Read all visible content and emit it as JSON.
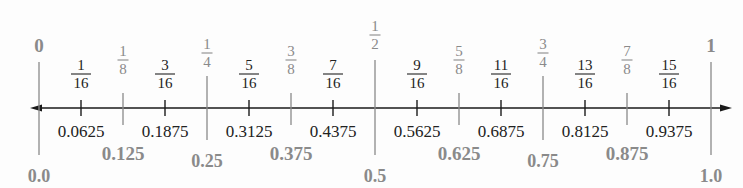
{
  "colors": {
    "axis": "#1a1a1a",
    "minor_tick": "#1a1a1a",
    "minor_text": "#222222",
    "major_line": "#8a8a8a",
    "major_text": "#8a8a8a"
  },
  "axis": {
    "x_start": 30,
    "x_end": 732,
    "y": 108,
    "x0": 39,
    "x1": 711
  },
  "ticks": [
    {
      "value": 0,
      "num": "",
      "den": "",
      "whole": "0",
      "decimal": "0.0",
      "level": 0
    },
    {
      "value": 0.0625,
      "num": "1",
      "den": "16",
      "decimal": "0.0625",
      "level": 3
    },
    {
      "value": 0.125,
      "num": "1",
      "den": "8",
      "decimal": "0.125",
      "level": 2
    },
    {
      "value": 0.1875,
      "num": "3",
      "den": "16",
      "decimal": "0.1875",
      "level": 3
    },
    {
      "value": 0.25,
      "num": "1",
      "den": "4",
      "decimal": "0.25",
      "level": 1
    },
    {
      "value": 0.3125,
      "num": "5",
      "den": "16",
      "decimal": "0.3125",
      "level": 3
    },
    {
      "value": 0.375,
      "num": "3",
      "den": "8",
      "decimal": "0.375",
      "level": 2
    },
    {
      "value": 0.4375,
      "num": "7",
      "den": "16",
      "decimal": "0.4375",
      "level": 3
    },
    {
      "value": 0.5,
      "num": "1",
      "den": "2",
      "decimal": "0.5",
      "level": 0.5
    },
    {
      "value": 0.5625,
      "num": "9",
      "den": "16",
      "decimal": "0.5625",
      "level": 3
    },
    {
      "value": 0.625,
      "num": "5",
      "den": "8",
      "decimal": "0.625",
      "level": 2
    },
    {
      "value": 0.6875,
      "num": "11",
      "den": "16",
      "decimal": "0.6875",
      "level": 3
    },
    {
      "value": 0.75,
      "num": "3",
      "den": "4",
      "decimal": "0.75",
      "level": 1
    },
    {
      "value": 0.8125,
      "num": "13",
      "den": "16",
      "decimal": "0.8125",
      "level": 3
    },
    {
      "value": 0.875,
      "num": "7",
      "den": "8",
      "decimal": "0.875",
      "level": 2
    },
    {
      "value": 0.9375,
      "num": "15",
      "den": "16",
      "decimal": "0.9375",
      "level": 3
    },
    {
      "value": 1,
      "num": "",
      "den": "",
      "whole": "1",
      "decimal": "1.0",
      "level": 0
    }
  ]
}
